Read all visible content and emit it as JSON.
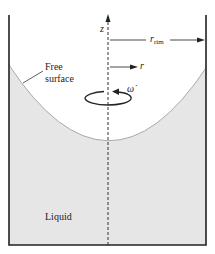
{
  "diagram": {
    "labels": {
      "z_axis": "z",
      "r_rim_symbol": "r",
      "r_rim_subscript": "rim",
      "r_axis": "r",
      "omega": "ω̇",
      "free_surface_line1": "Free",
      "free_surface_line2": "surface",
      "liquid": "Liquid"
    },
    "colors": {
      "liquid_fill": "#e6e6e6",
      "surface_line": "#a8a8a8",
      "wall": "#222222",
      "axis": "#333333",
      "background": "#ffffff"
    }
  }
}
